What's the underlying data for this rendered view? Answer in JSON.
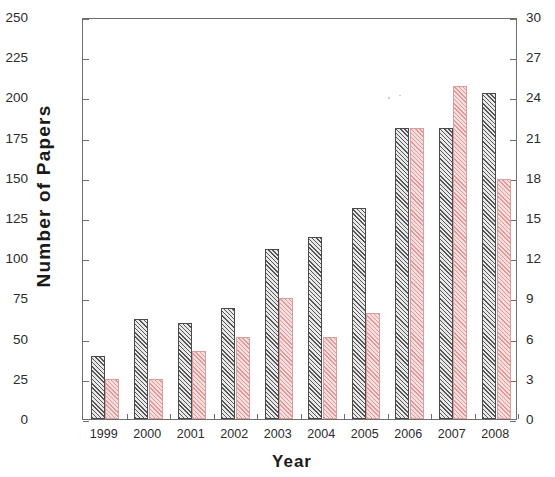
{
  "chart_data": {
    "type": "bar",
    "title": "",
    "xlabel": "Year",
    "ylabel": "Number of Papers",
    "ylabel_right": "",
    "categories": [
      "1999",
      "2000",
      "2001",
      "2002",
      "2003",
      "2004",
      "2005",
      "2006",
      "2007",
      "2008"
    ],
    "ylim": [
      0,
      250
    ],
    "yticks": [
      0,
      25,
      50,
      75,
      100,
      125,
      150,
      175,
      200,
      225,
      250
    ],
    "ylim_right": [
      0,
      30
    ],
    "yticks_right": [
      0,
      3,
      6,
      9,
      12,
      15,
      18,
      21,
      24,
      27,
      30
    ],
    "grid": false,
    "legend": "none",
    "series": [
      {
        "name": "Series 1",
        "axis": "left",
        "color": "#4a4a4a",
        "fill": "#e9e9e9",
        "hatch": "diagonal",
        "values": [
          39,
          62,
          60,
          69,
          106,
          113,
          131,
          181,
          181,
          203
        ]
      },
      {
        "name": "Series 2",
        "axis": "right",
        "color": "#d99e9e",
        "fill": "#f7dede",
        "hatch": "diagonal",
        "values": [
          3,
          3,
          5,
          6,
          9,
          6,
          8,
          21.7,
          24.8,
          17.8
        ],
        "values_left_scale": [
          25,
          25,
          42,
          51,
          75,
          51,
          66,
          181,
          207,
          149
        ]
      }
    ]
  },
  "axis_left": {
    "labels": [
      "250",
      "225",
      "200",
      "175",
      "150",
      "125",
      "100",
      "75",
      "50",
      "25",
      "0"
    ],
    "values": [
      250,
      225,
      200,
      175,
      150,
      125,
      100,
      75,
      50,
      25,
      0
    ]
  },
  "axis_right": {
    "labels": [
      "30",
      "27",
      "24",
      "21",
      "18",
      "15",
      "12",
      "9",
      "6",
      "3",
      "0"
    ],
    "values": [
      30,
      27,
      24,
      21,
      18,
      15,
      12,
      9,
      6,
      3,
      0
    ]
  },
  "axis_x": {
    "title": "Year",
    "labels": [
      "1999",
      "2000",
      "2001",
      "2002",
      "2003",
      "2004",
      "2005",
      "2006",
      "2007",
      "2008"
    ]
  },
  "axis_y": {
    "title": "Number of Papers"
  }
}
